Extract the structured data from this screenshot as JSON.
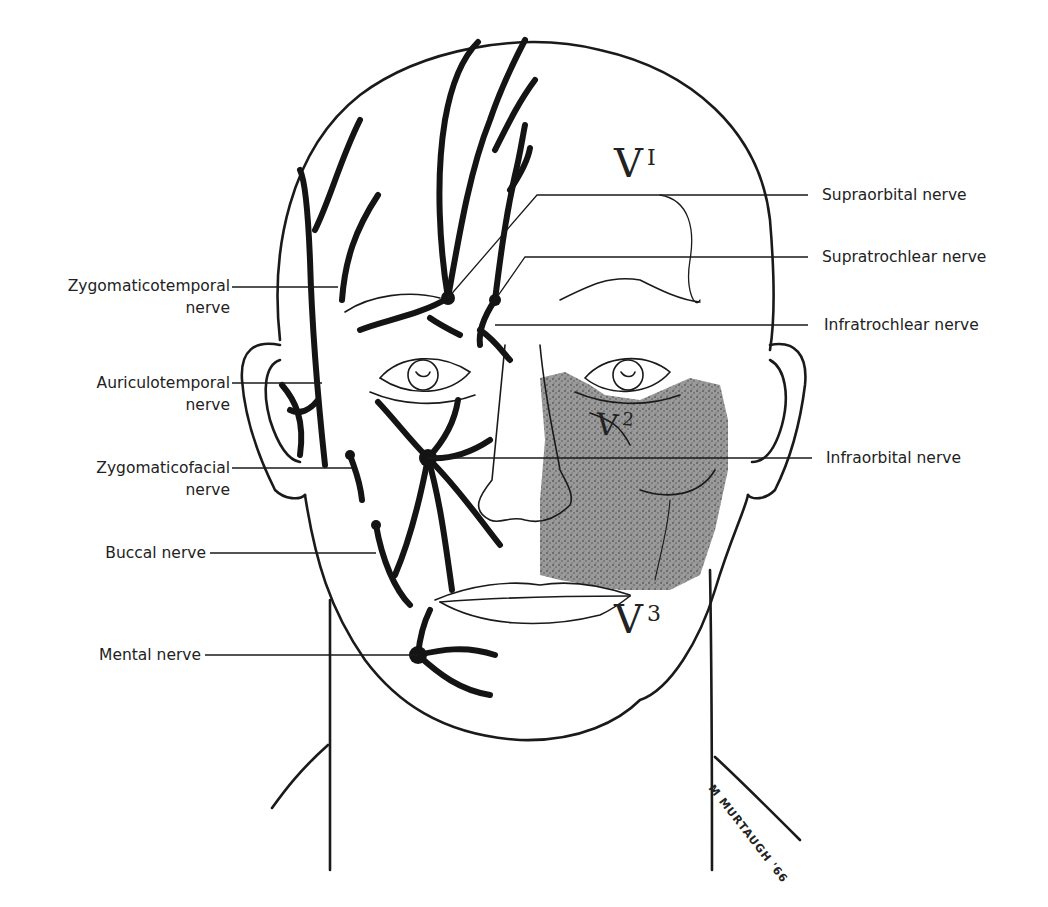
{
  "figure": {
    "signature": "M MURTAUGH '66"
  },
  "divisions": [
    {
      "id": "V1",
      "letter": "V",
      "superscript": "I"
    },
    {
      "id": "V2",
      "letter": "V",
      "superscript": "2"
    },
    {
      "id": "V3",
      "letter": "V",
      "superscript": "3"
    }
  ],
  "labels": {
    "left": [
      {
        "line1": "Zygomaticotemporal",
        "line2": "nerve"
      },
      {
        "line1": "Auriculotemporal",
        "line2": "nerve"
      },
      {
        "line1": "Zygomaticofacial",
        "line2": "nerve"
      },
      {
        "line1": "Buccal nerve",
        "line2": ""
      },
      {
        "line1": "Mental nerve",
        "line2": ""
      }
    ],
    "right": [
      {
        "line1": "Supraorbital nerve"
      },
      {
        "line1": "Supratrochlear nerve"
      },
      {
        "line1": "Infratrochlear nerve"
      },
      {
        "line1": "Infraorbital nerve"
      }
    ]
  },
  "colors": {
    "ink": "#1a1a1a",
    "stipple_region": "#8a8a8a",
    "background": "#ffffff"
  }
}
